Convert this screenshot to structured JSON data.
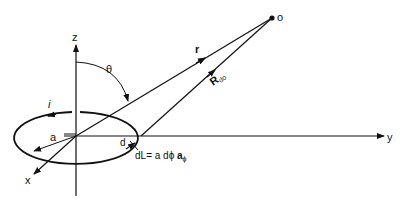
{
  "diagram": {
    "type": "magnetic-field-of-current-loop",
    "axes": {
      "x": "x",
      "y": "y",
      "z": "z"
    },
    "labels": {
      "current": "i",
      "radius": "a",
      "angle": "θ",
      "position_vector": "r",
      "point": "o",
      "separation_vector": "R",
      "separation_subscript": "do",
      "element_point": "d",
      "dl_lhs": "dL",
      "dl_rhs_a": "= a dϕ ",
      "dl_rhs_vec": "a",
      "dl_rhs_sub": "ϕ"
    },
    "colors": {
      "stroke": "#111111",
      "background": "#ffffff"
    }
  }
}
